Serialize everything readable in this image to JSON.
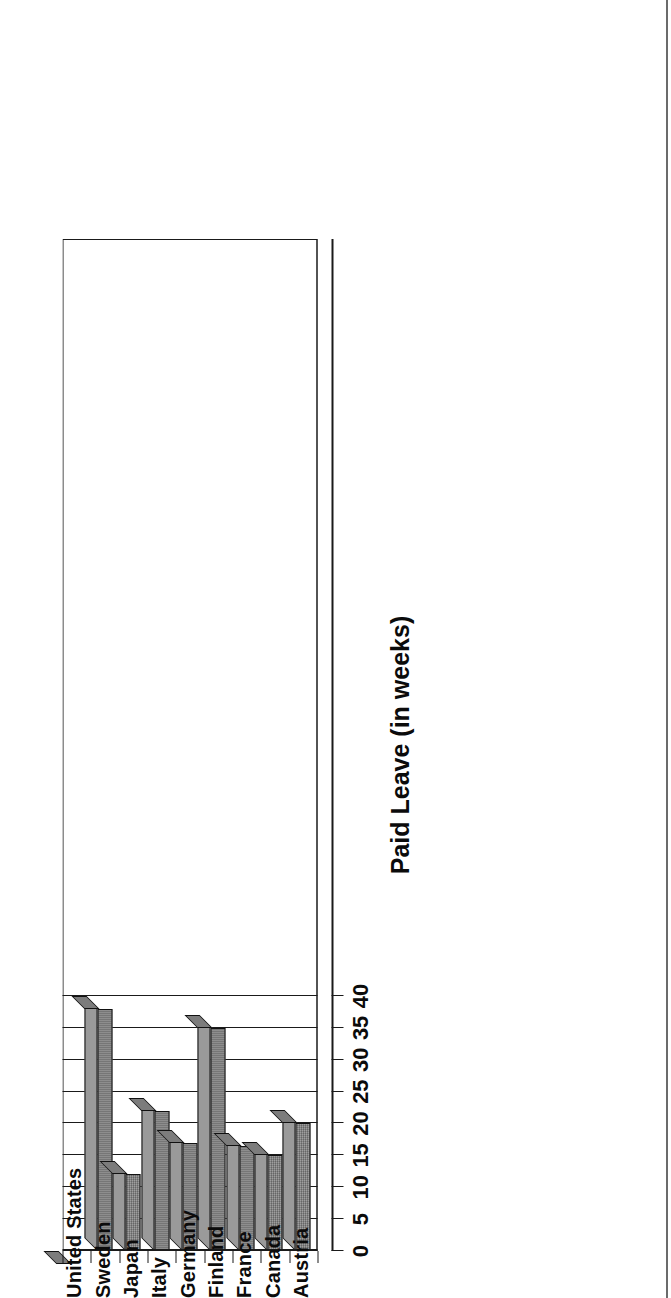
{
  "chart_data": {
    "type": "bar",
    "title": "",
    "xlabel": "",
    "ylabel": "Paid Leave (in weeks)",
    "categories": [
      "United States",
      "Sweden",
      "Japan",
      "Italy",
      "Germany",
      "Finland",
      "France",
      "Canada",
      "Austria"
    ],
    "values": [
      0,
      38,
      12,
      22,
      17,
      35,
      16.5,
      15,
      20
    ],
    "ylim": [
      0,
      40
    ],
    "yticks": [
      0,
      5,
      10,
      15,
      20,
      25,
      30,
      35,
      40
    ],
    "ytick_labels": [
      "0",
      "5",
      "10",
      "15",
      "20",
      "25",
      "30",
      "35",
      "40"
    ],
    "grid": true,
    "legend": "none",
    "orientation": "vertical-bars-3d",
    "page_rotation_degrees": 90,
    "bar_fill_color": "#8a8a8a",
    "bar_edge_color": "#111111",
    "axis_color": "#1a1a1a",
    "background_color": "#ffffff"
  },
  "figure": {
    "value_axis_title": "Paid Leave (in weeks)"
  }
}
